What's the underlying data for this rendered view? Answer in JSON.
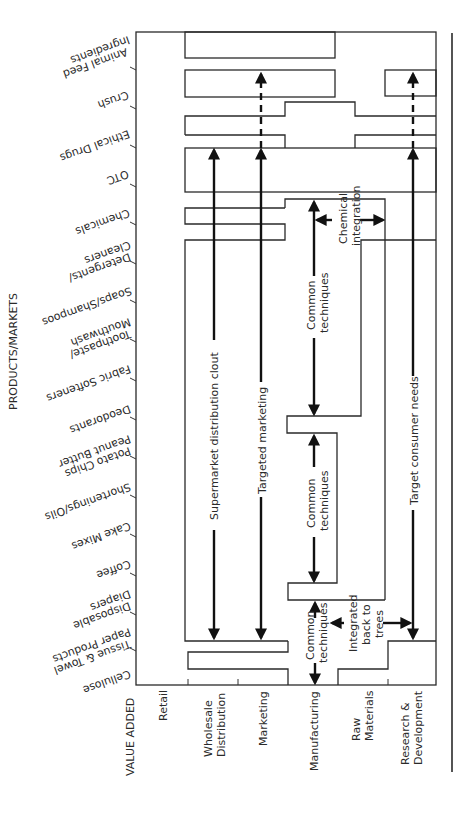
{
  "diagram": {
    "axis_titles": {
      "products_markets": "PRODUCTS/MARKETS",
      "value_added": "VALUE ADDED"
    },
    "value_added_stages": [
      {
        "label_line1": "Retail",
        "label_line2": ""
      },
      {
        "label_line1": "Wholesale",
        "label_line2": "Distribution"
      },
      {
        "label_line1": "Marketing",
        "label_line2": ""
      },
      {
        "label_line1": "Manufacturing",
        "label_line2": ""
      },
      {
        "label_line1": "Raw",
        "label_line2": "Materials"
      },
      {
        "label_line1": "Research &",
        "label_line2": "Development"
      }
    ],
    "products_markets": [
      {
        "line1": "Animal Feed",
        "line2": "Ingredients"
      },
      {
        "line1": "Crush",
        "line2": ""
      },
      {
        "line1": "Ethical Drugs",
        "line2": ""
      },
      {
        "line1": "OTC",
        "line2": ""
      },
      {
        "line1": "Chemicals",
        "line2": ""
      },
      {
        "line1": "Detergents/",
        "line2": "Cleaners"
      },
      {
        "line1": "Soaps/Shampoos",
        "line2": ""
      },
      {
        "line1": "Toothpaste/",
        "line2": "Mouthwash"
      },
      {
        "line1": "Fabric Softeners",
        "line2": ""
      },
      {
        "line1": "Deodorants",
        "line2": ""
      },
      {
        "line1": "Potato Chips",
        "line2": "Peanut Butter"
      },
      {
        "line1": "Shortenings/Oils",
        "line2": ""
      },
      {
        "line1": "Cake Mixes",
        "line2": ""
      },
      {
        "line1": "Coffee",
        "line2": ""
      },
      {
        "line1": "Disposable",
        "line2": "Diapers"
      },
      {
        "line1": "Tissue & Towel",
        "line2": "Paper Products"
      },
      {
        "line1": "Cellulose",
        "line2": ""
      }
    ],
    "annotations": {
      "supermarket": "Supermarket distribution clout",
      "targeted_marketing": "Targeted marketing",
      "common_techniques_1_l1": "Common",
      "common_techniques_1_l2": "techniques",
      "chemical_integration_l1": "Chemical",
      "chemical_integration_l2": "integration",
      "common_techniques_2_l1": "Common",
      "common_techniques_2_l2": "techniques",
      "common_techniques_3_l1": "Common",
      "common_techniques_3_l2": "techniques",
      "integrated_l1": "Integrated",
      "integrated_l2": "back to",
      "integrated_l3": "trees",
      "target_consumer": "Target consumer needs"
    },
    "colors": {
      "line": "#2a2a2a",
      "background": "#ffffff"
    }
  }
}
